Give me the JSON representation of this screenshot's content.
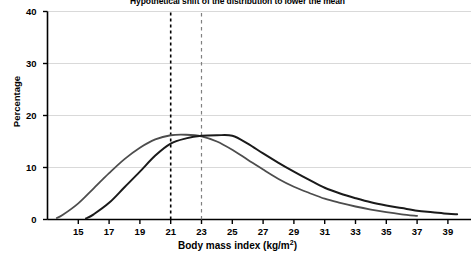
{
  "chart_data": {
    "type": "line",
    "title": "Hypothetical shift of the distribution to lower the mean",
    "xlabel": "Body mass index (kg/m",
    "xlabel_sup": "2",
    "xlabel_tail": ")",
    "ylabel": "Percentage",
    "xlim": [
      13,
      40.5
    ],
    "ylim": [
      0,
      40
    ],
    "xticks": [
      15,
      17,
      19,
      21,
      23,
      25,
      27,
      29,
      31,
      33,
      35,
      37,
      39
    ],
    "yticks": [
      0,
      10,
      20,
      30,
      40
    ],
    "grid": "horizontal",
    "legend": "none",
    "series": [
      {
        "name": "shifted-distribution",
        "color": "#4d4d4d",
        "width": 1.8,
        "x": [
          13.6,
          14.0,
          15.0,
          16.0,
          17.0,
          18.0,
          19.0,
          20.0,
          21.0,
          22.0,
          23.0,
          24.0,
          25.0,
          26.0,
          27.0,
          28.0,
          29.0,
          30.0,
          31.0,
          32.0,
          33.0,
          34.0,
          35.0,
          36.0,
          37.0
        ],
        "y": [
          0.3,
          0.9,
          3.1,
          6.0,
          8.9,
          11.6,
          13.8,
          15.4,
          16.2,
          16.3,
          16.0,
          15.0,
          13.4,
          11.5,
          9.6,
          7.8,
          6.3,
          5.1,
          4.0,
          3.2,
          2.5,
          1.9,
          1.4,
          1.0,
          0.7
        ]
      },
      {
        "name": "original-distribution",
        "color": "#1a1a1a",
        "width": 2.0,
        "x": [
          15.5,
          16.0,
          17.0,
          18.0,
          19.0,
          20.0,
          21.0,
          22.0,
          23.0,
          24.0,
          25.0,
          26.0,
          27.0,
          28.0,
          29.0,
          30.0,
          31.0,
          32.0,
          33.0,
          34.0,
          35.0,
          36.0,
          37.0,
          38.0,
          39.0,
          39.6
        ],
        "y": [
          0.2,
          1.0,
          3.2,
          6.2,
          9.2,
          12.3,
          14.6,
          15.6,
          16.1,
          16.2,
          16.1,
          14.6,
          12.7,
          10.9,
          9.2,
          7.6,
          6.1,
          5.0,
          4.1,
          3.3,
          2.7,
          2.2,
          1.7,
          1.4,
          1.1,
          1.0
        ]
      }
    ],
    "vlines": [
      {
        "name": "shifted-mean-line",
        "x": 21,
        "color": "#000000",
        "style": "dashed",
        "width": 1.6
      },
      {
        "name": "original-mean-line",
        "x": 23,
        "color": "#808080",
        "style": "dashed",
        "width": 1.2
      }
    ],
    "axis_color": "#000000",
    "grid_color": "#d9d9d9"
  }
}
